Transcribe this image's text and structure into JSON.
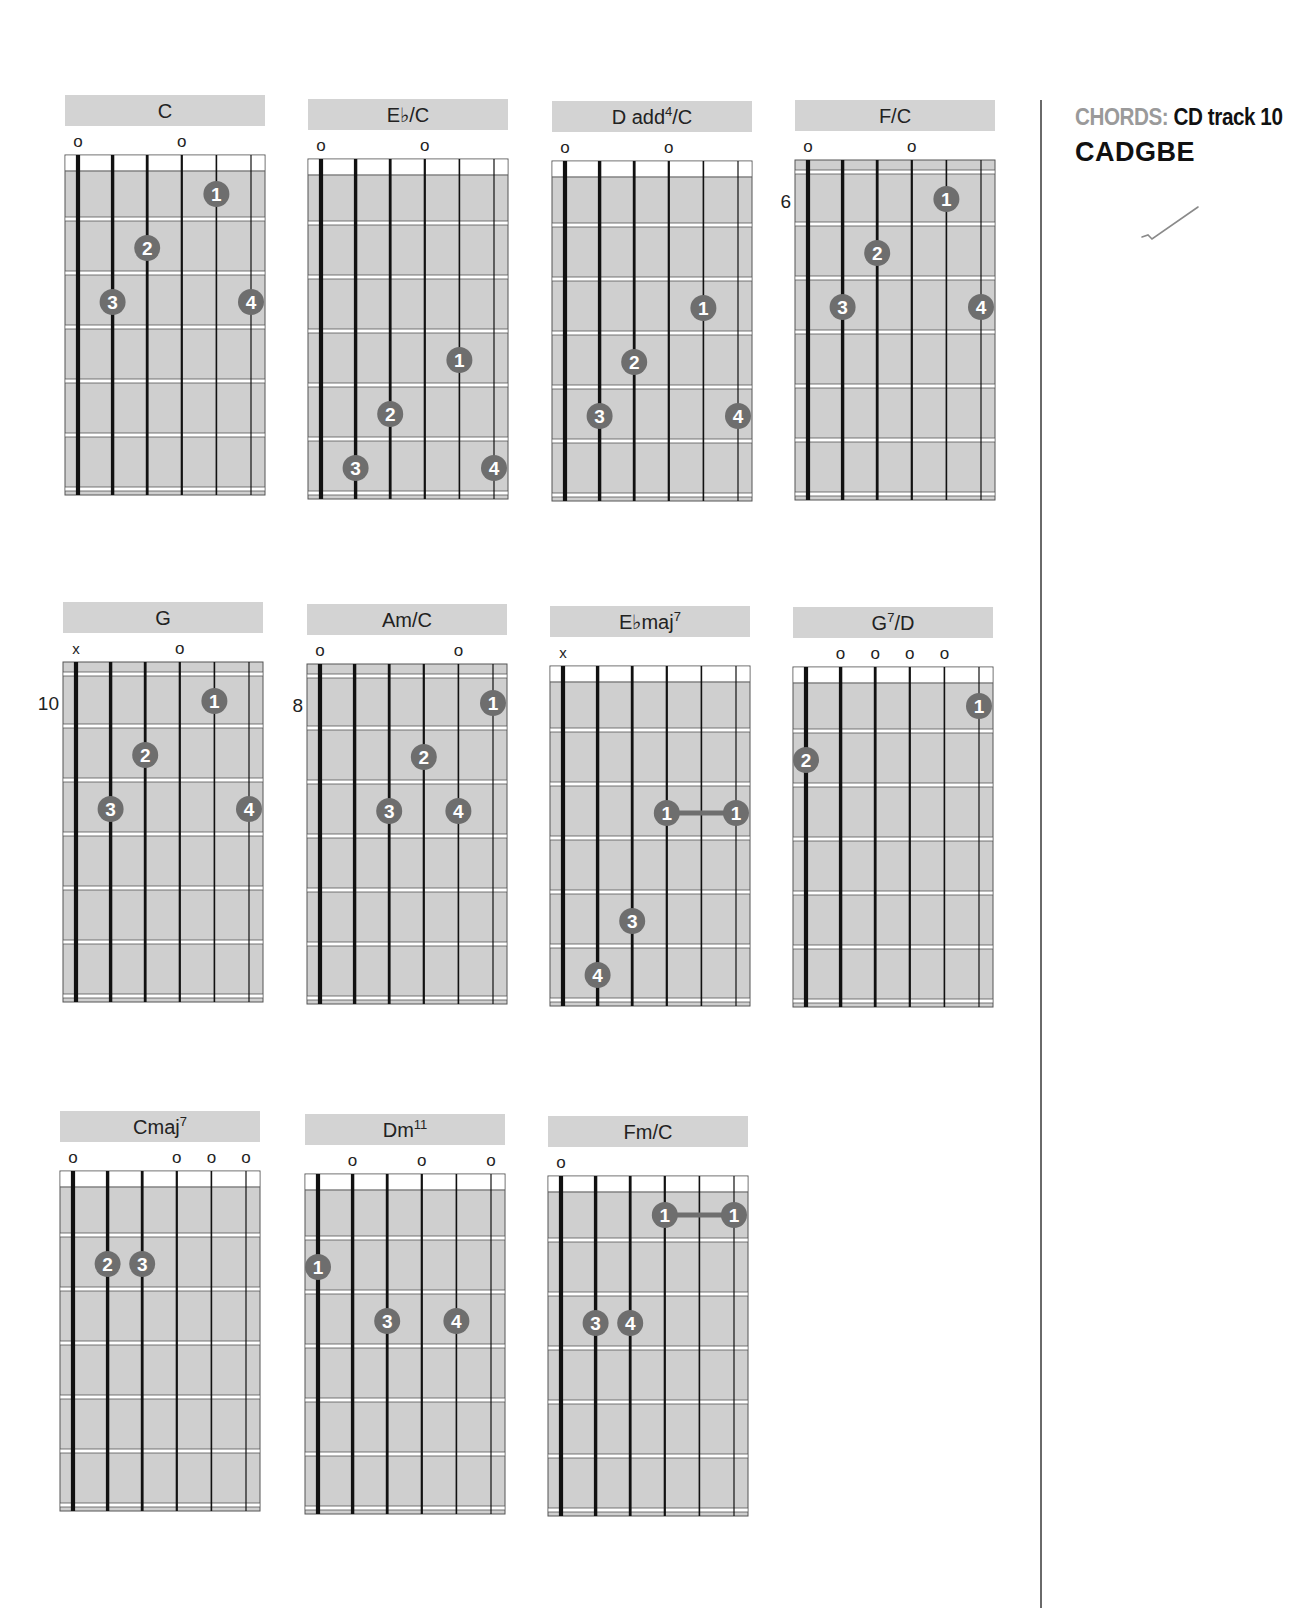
{
  "sidebar": {
    "heading_label": "CHORDS:",
    "heading_value": "CD track 10",
    "tuning": "CADGBE",
    "check_icon": "check-mark"
  },
  "colors": {
    "title_bar": "#d3d3d3",
    "fretboard": "#cfcfcf",
    "dot": "#6e6e6e",
    "dot_text": "#ffffff",
    "string": "#111111"
  },
  "chords": [
    {
      "id": "c",
      "name": "C",
      "sup": "",
      "suffix": "",
      "x": 65,
      "y": 95,
      "markers": [
        "o",
        "",
        "",
        "o",
        "",
        ""
      ],
      "position": "",
      "nut": true,
      "dots": [
        {
          "s": 5,
          "f": 1,
          "n": "1"
        },
        {
          "s": 3,
          "f": 2,
          "n": "2"
        },
        {
          "s": 2,
          "f": 3,
          "n": "3"
        },
        {
          "s": 6,
          "f": 3,
          "n": "4"
        }
      ],
      "barres": []
    },
    {
      "id": "eb-c",
      "name": "E♭/C",
      "sup": "",
      "suffix": "",
      "x": 308,
      "y": 99,
      "markers": [
        "o",
        "",
        "",
        "o",
        "",
        ""
      ],
      "position": "",
      "nut": true,
      "dots": [
        {
          "s": 5,
          "f": 4,
          "n": "1"
        },
        {
          "s": 3,
          "f": 5,
          "n": "2"
        },
        {
          "s": 2,
          "f": 6,
          "n": "3"
        },
        {
          "s": 6,
          "f": 6,
          "n": "4"
        }
      ],
      "barres": []
    },
    {
      "id": "d-add4-c",
      "name": "D add",
      "sup": "4",
      "suffix": "/C",
      "x": 552,
      "y": 101,
      "markers": [
        "o",
        "",
        "",
        "o",
        "",
        ""
      ],
      "position": "",
      "nut": true,
      "dots": [
        {
          "s": 5,
          "f": 3,
          "n": "1"
        },
        {
          "s": 3,
          "f": 4,
          "n": "2"
        },
        {
          "s": 2,
          "f": 5,
          "n": "3"
        },
        {
          "s": 6,
          "f": 5,
          "n": "4"
        }
      ],
      "barres": []
    },
    {
      "id": "f-c",
      "name": "F/C",
      "sup": "",
      "suffix": "",
      "x": 795,
      "y": 100,
      "markers": [
        "o",
        "",
        "",
        "o",
        "",
        ""
      ],
      "position": "6",
      "nut": false,
      "dots": [
        {
          "s": 5,
          "f": 1,
          "n": "1"
        },
        {
          "s": 3,
          "f": 2,
          "n": "2"
        },
        {
          "s": 2,
          "f": 3,
          "n": "3"
        },
        {
          "s": 6,
          "f": 3,
          "n": "4"
        }
      ],
      "barres": []
    },
    {
      "id": "g",
      "name": "G",
      "sup": "",
      "suffix": "",
      "x": 63,
      "y": 602,
      "markers": [
        "x",
        "",
        "",
        "o",
        "",
        ""
      ],
      "position": "10",
      "nut": false,
      "dots": [
        {
          "s": 5,
          "f": 1,
          "n": "1"
        },
        {
          "s": 3,
          "f": 2,
          "n": "2"
        },
        {
          "s": 2,
          "f": 3,
          "n": "3"
        },
        {
          "s": 6,
          "f": 3,
          "n": "4"
        }
      ],
      "barres": []
    },
    {
      "id": "am-c",
      "name": "Am/C",
      "sup": "",
      "suffix": "",
      "x": 307,
      "y": 604,
      "markers": [
        "o",
        "",
        "",
        "",
        "o",
        ""
      ],
      "position": "8",
      "nut": false,
      "dots": [
        {
          "s": 6,
          "f": 1,
          "n": "1"
        },
        {
          "s": 4,
          "f": 2,
          "n": "2"
        },
        {
          "s": 3,
          "f": 3,
          "n": "3"
        },
        {
          "s": 5,
          "f": 3,
          "n": "4"
        }
      ],
      "barres": []
    },
    {
      "id": "ebmaj7",
      "name": "E♭maj",
      "sup": "7",
      "suffix": "",
      "x": 550,
      "y": 606,
      "markers": [
        "x",
        "",
        "",
        "",
        "",
        ""
      ],
      "position": "",
      "nut": true,
      "dots": [
        {
          "s": 3,
          "f": 5,
          "n": "3"
        },
        {
          "s": 2,
          "f": 6,
          "n": "4"
        }
      ],
      "barres": [
        {
          "from": 4,
          "to": 6,
          "f": 3,
          "n": "1"
        }
      ]
    },
    {
      "id": "g7-d",
      "name": "G",
      "sup": "7",
      "suffix": "/D",
      "x": 793,
      "y": 607,
      "markers": [
        "",
        "o",
        "o",
        "o",
        "o",
        ""
      ],
      "position": "",
      "nut": true,
      "dots": [
        {
          "s": 6,
          "f": 1,
          "n": "1"
        },
        {
          "s": 1,
          "f": 2,
          "n": "2"
        }
      ],
      "barres": []
    },
    {
      "id": "cmaj7",
      "name": "Cmaj",
      "sup": "7",
      "suffix": "",
      "x": 60,
      "y": 1111,
      "markers": [
        "o",
        "",
        "",
        "o",
        "o",
        "o"
      ],
      "position": "",
      "nut": true,
      "dots": [
        {
          "s": 2,
          "f": 2,
          "n": "2"
        },
        {
          "s": 3,
          "f": 2,
          "n": "3"
        }
      ],
      "barres": []
    },
    {
      "id": "dm11",
      "name": "Dm",
      "sup": "11",
      "suffix": "",
      "x": 305,
      "y": 1114,
      "markers": [
        "",
        "o",
        "",
        "o",
        "",
        "o"
      ],
      "position": "",
      "nut": true,
      "dots": [
        {
          "s": 1,
          "f": 2,
          "n": "1"
        },
        {
          "s": 3,
          "f": 3,
          "n": "3"
        },
        {
          "s": 5,
          "f": 3,
          "n": "4"
        }
      ],
      "barres": []
    },
    {
      "id": "fm-c",
      "name": "Fm/C",
      "sup": "",
      "suffix": "",
      "x": 548,
      "y": 1116,
      "markers": [
        "o",
        "",
        "",
        "",
        "",
        ""
      ],
      "position": "",
      "nut": true,
      "dots": [
        {
          "s": 2,
          "f": 3,
          "n": "3"
        },
        {
          "s": 3,
          "f": 3,
          "n": "4"
        }
      ],
      "barres": [
        {
          "from": 4,
          "to": 6,
          "f": 1,
          "n": "1"
        }
      ]
    }
  ]
}
